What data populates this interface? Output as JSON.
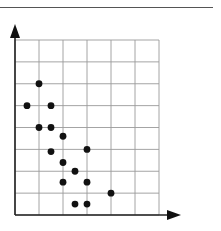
{
  "chart_data": {
    "type": "scatter",
    "title": "",
    "xlabel": "",
    "ylabel": "",
    "x_ticks": [],
    "y_ticks": [],
    "grid": true,
    "grid_columns": 6,
    "grid_rows": 8,
    "xlim": [
      0,
      6
    ],
    "ylim": [
      0,
      8
    ],
    "legend": null,
    "points": [
      {
        "x": 1.0,
        "y": 6.0
      },
      {
        "x": 0.5,
        "y": 5.0
      },
      {
        "x": 1.5,
        "y": 5.0
      },
      {
        "x": 1.0,
        "y": 4.0
      },
      {
        "x": 1.5,
        "y": 4.0
      },
      {
        "x": 2.0,
        "y": 3.6
      },
      {
        "x": 1.5,
        "y": 2.9
      },
      {
        "x": 3.0,
        "y": 3.0
      },
      {
        "x": 2.0,
        "y": 2.4
      },
      {
        "x": 2.5,
        "y": 2.0
      },
      {
        "x": 2.0,
        "y": 1.5
      },
      {
        "x": 3.0,
        "y": 1.5
      },
      {
        "x": 4.0,
        "y": 1.0
      },
      {
        "x": 2.5,
        "y": 0.5
      },
      {
        "x": 3.0,
        "y": 0.5
      }
    ]
  },
  "colors": {
    "grid": "#9a9a9a",
    "axis": "#222222",
    "point": "#111111"
  }
}
